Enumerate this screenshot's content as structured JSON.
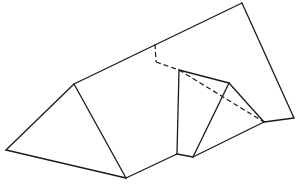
{
  "diagram": {
    "type": "geometric-solid-line-drawing",
    "colors": {
      "line": "#1a1a1a",
      "background": "#ffffff"
    },
    "vertices": {
      "A": [
        6,
        150
      ],
      "B": [
        74,
        84
      ],
      "C": [
        126,
        178
      ],
      "D": [
        242,
        3
      ],
      "E": [
        294,
        118
      ],
      "F": [
        155,
        44
      ],
      "G": [
        156,
        62
      ],
      "H": [
        179,
        70
      ],
      "I": [
        229,
        83
      ],
      "J": [
        264,
        122
      ],
      "K": [
        177,
        154
      ],
      "L": [
        193,
        157
      ]
    },
    "solid_edges": [
      [
        "A",
        "B"
      ],
      [
        "B",
        "C"
      ],
      [
        "A",
        "C"
      ],
      [
        "B",
        "D"
      ],
      [
        "D",
        "E"
      ],
      [
        "H",
        "I"
      ],
      [
        "I",
        "J"
      ],
      [
        "H",
        "K"
      ],
      [
        "K",
        "L"
      ],
      [
        "I",
        "L"
      ],
      [
        "L",
        "J"
      ],
      [
        "C",
        "K"
      ],
      [
        "J",
        "E"
      ]
    ],
    "hidden_edges": [
      [
        "F",
        "G"
      ],
      [
        "G",
        "H"
      ],
      [
        "H",
        "J"
      ]
    ]
  }
}
